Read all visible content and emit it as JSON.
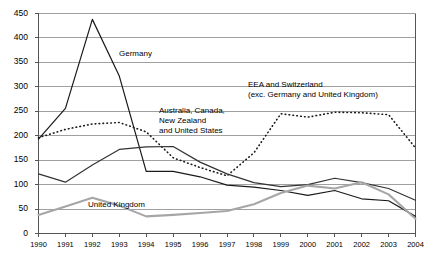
{
  "chart_data": {
    "type": "line",
    "title": "",
    "xlabel": "",
    "ylabel": "",
    "grid": true,
    "legend_position": "inline-annotations",
    "x": [
      1990,
      1991,
      1992,
      1993,
      1994,
      1995,
      1996,
      1997,
      1998,
      1999,
      2000,
      2001,
      2002,
      2003,
      2004
    ],
    "xlim": [
      1990,
      2004
    ],
    "ylim": [
      0,
      450
    ],
    "yticks": [
      0,
      50,
      100,
      150,
      200,
      250,
      300,
      350,
      400,
      450
    ],
    "xticks": [
      "1990",
      "1991",
      "1992",
      "1993",
      "1994",
      "1995",
      "1996",
      "1997",
      "1998",
      "1999",
      "2000",
      "2001",
      "2002",
      "2003",
      "2004"
    ],
    "series": [
      {
        "name": "Germany",
        "style": "solid-dark",
        "color": "#1a1a1a",
        "values": [
          193,
          256,
          438,
          322,
          127,
          127,
          116,
          99,
          95,
          88,
          78,
          88,
          71,
          67,
          35
        ]
      },
      {
        "name": "EEA and Switzerland (exc. Germany and United Kingdom)",
        "style": "dotted",
        "color": "#1a1a1a",
        "values": [
          196,
          213,
          224,
          227,
          208,
          155,
          135,
          118,
          165,
          245,
          238,
          248,
          247,
          243,
          175
        ]
      },
      {
        "name": "Australia, Canada, New Zealand and United States",
        "style": "solid-dark",
        "color": "#333333",
        "values": [
          122,
          105,
          140,
          172,
          177,
          178,
          146,
          122,
          104,
          96,
          100,
          113,
          104,
          92,
          68
        ]
      },
      {
        "name": "United Kingdom",
        "style": "solid-gray",
        "color": "#a6a6a6",
        "values": [
          38,
          55,
          73,
          57,
          35,
          38,
          42,
          46,
          60,
          83,
          98,
          92,
          105,
          80,
          30
        ]
      }
    ],
    "annotations": [
      {
        "id": "germany-label",
        "text": "Germany",
        "x_px": 119,
        "y_px": 49
      },
      {
        "id": "eea-label-line1",
        "text": "EEA and Switzerland",
        "x_px": 248,
        "y_px": 80
      },
      {
        "id": "eea-label-line2",
        "text": "(exc. Germany and United Kingdom)",
        "x_px": 248,
        "y_px": 90
      },
      {
        "id": "acnzus-label-line1",
        "text": "Australia, Canada,",
        "x_px": 159,
        "y_px": 106
      },
      {
        "id": "acnzus-label-line2",
        "text": "New Zealand",
        "x_px": 159,
        "y_px": 116
      },
      {
        "id": "acnzus-label-line3",
        "text": "and United States",
        "x_px": 159,
        "y_px": 126
      },
      {
        "id": "uk-label",
        "text": "United Kingdom",
        "x_px": 88,
        "y_px": 200
      }
    ]
  }
}
